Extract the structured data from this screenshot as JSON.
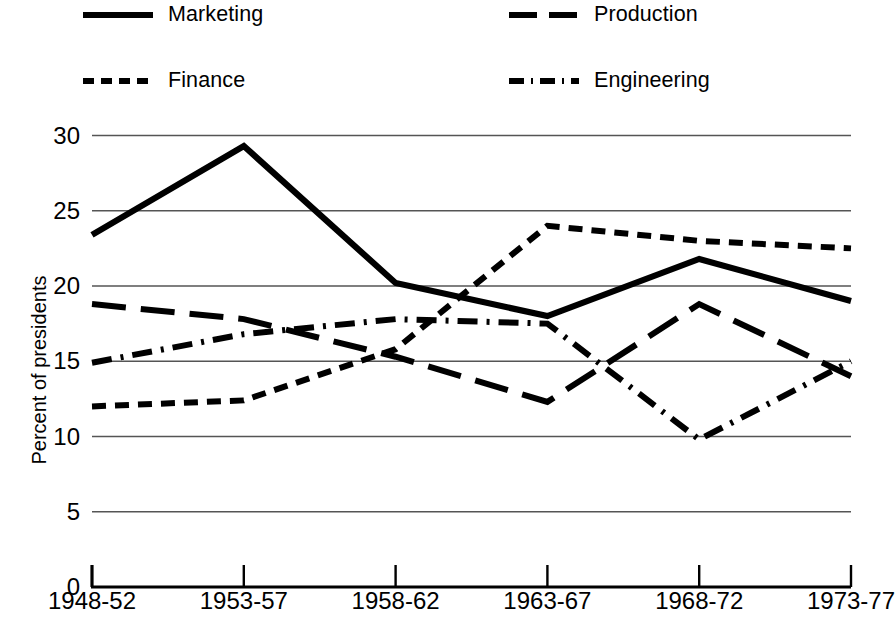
{
  "chart_data": {
    "type": "line",
    "title": "",
    "xlabel": "",
    "ylabel": "Percent of presidents",
    "categories": [
      "1948-52",
      "1953-57",
      "1958-62",
      "1963-67",
      "1968-72",
      "1973-77"
    ],
    "ylim": [
      0,
      30
    ],
    "yticks": [
      0,
      5,
      10,
      15,
      20,
      25,
      30
    ],
    "grid": true,
    "legend_position": "top",
    "series": [
      {
        "name": "Marketing",
        "style": "solid",
        "values": [
          23.4,
          29.3,
          20.2,
          18.0,
          21.8,
          19.0
        ]
      },
      {
        "name": "Production",
        "style": "long-dash",
        "values": [
          18.8,
          17.8,
          15.3,
          12.3,
          18.8,
          14.0
        ]
      },
      {
        "name": "Finance",
        "style": "short-dash",
        "values": [
          12.0,
          12.4,
          15.8,
          24.0,
          23.0,
          22.5
        ]
      },
      {
        "name": "Engineering",
        "style": "dash-dot",
        "values": [
          14.9,
          16.8,
          17.8,
          17.5,
          9.8,
          15.0
        ]
      }
    ]
  },
  "legend": {
    "items": [
      {
        "label": "Marketing",
        "style": "solid"
      },
      {
        "label": "Production",
        "style": "long-dash"
      },
      {
        "label": "Finance",
        "style": "short-dash"
      },
      {
        "label": "Engineering",
        "style": "dash-dot"
      }
    ]
  },
  "axes": {
    "y_title": "Percent of presidents",
    "y_labels": [
      "0",
      "5",
      "10",
      "15",
      "20",
      "25",
      "30"
    ],
    "x_labels": [
      "1948-52",
      "1953-57",
      "1958-62",
      "1963-67",
      "1968-72",
      "1973-77"
    ]
  },
  "colors": {
    "ink": "#000000",
    "grid": "#555555",
    "background": "#ffffff"
  }
}
